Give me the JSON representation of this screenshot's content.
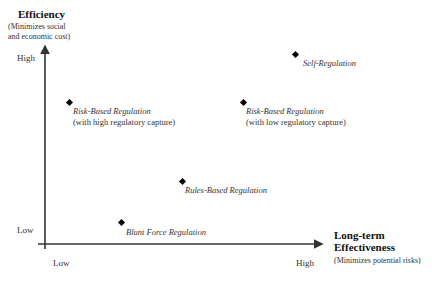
{
  "y_axis": {
    "title": "Efficiency",
    "subtitle_line1": "(Minimizes social",
    "subtitle_line2": "and economic cost)",
    "high_label": "High",
    "low_label": "Low"
  },
  "x_axis": {
    "title_line1": "Long-term",
    "title_line2": "Effectiveness",
    "subtitle": "(Minimizes potential risks)",
    "low_label": "Low",
    "high_label": "High"
  },
  "points": [
    {
      "name": "Self-Regulation",
      "note": "",
      "x": 295,
      "y": 54
    },
    {
      "name": "Risk-Based Regulation",
      "note": "(with high regulatory capture)",
      "x": 69,
      "y": 102
    },
    {
      "name": "Risk-Based Regulation",
      "note": "(with low regulatory capture)",
      "x": 243,
      "y": 102
    },
    {
      "name": "Rules-Based Regulation",
      "note": "",
      "x": 182,
      "y": 181
    },
    {
      "name": "Blunt Force Regulation",
      "note": "",
      "x": 121,
      "y": 222
    }
  ]
}
